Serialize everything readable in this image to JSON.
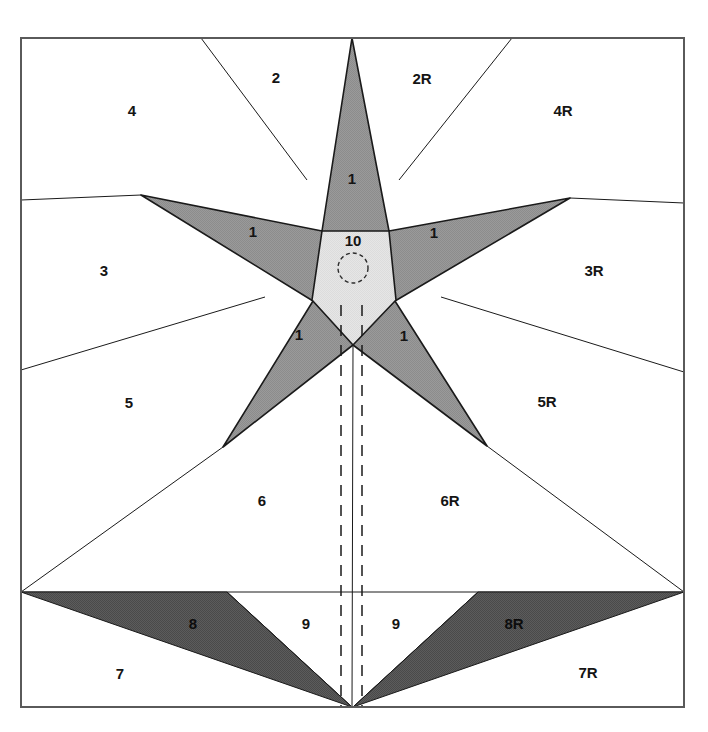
{
  "page": {
    "width": 708,
    "height": 732,
    "background": "#ffffff",
    "clipped_caption_left": "",
    "clipped_caption_right": ""
  },
  "figure": {
    "title": "",
    "frame": {
      "x": 21,
      "y": 38,
      "width": 663,
      "height": 669,
      "stroke": "#5a5a5a"
    },
    "colors": {
      "background": "#ffffff",
      "star_fill": "#9a9a9a",
      "core_fill": "#e2e2e2",
      "dark_fill": "#545454",
      "line": "#1a1a1a",
      "frame_line": "#5a5a5a",
      "label_text": "#141414"
    },
    "center_circle": {
      "cx": 353,
      "cy": 268,
      "r": 15,
      "style": "dashed"
    },
    "dashed_axes": [
      {
        "x": 341,
        "y1": 305,
        "y2": 707
      },
      {
        "x": 362,
        "y1": 305,
        "y2": 707
      }
    ],
    "regions": [
      {
        "id": "r1-top",
        "label": "1",
        "x": 352,
        "y": 180,
        "fill": "star"
      },
      {
        "id": "r1-upper-left",
        "label": "1",
        "x": 253,
        "y": 233,
        "fill": "star"
      },
      {
        "id": "r1-upper-right",
        "label": "1",
        "x": 434,
        "y": 234,
        "fill": "star"
      },
      {
        "id": "r1-lower-left",
        "label": "1",
        "x": 299,
        "y": 336,
        "fill": "star"
      },
      {
        "id": "r1-lower-right",
        "label": "1",
        "x": 404,
        "y": 337,
        "fill": "star"
      },
      {
        "id": "r10-core",
        "label": "10",
        "x": 353,
        "y": 242,
        "fill": "core"
      },
      {
        "id": "r2",
        "label": "2",
        "x": 276,
        "y": 79,
        "fill": "white"
      },
      {
        "id": "r2R",
        "label": "2R",
        "x": 422,
        "y": 80,
        "fill": "white"
      },
      {
        "id": "r4",
        "label": "4",
        "x": 132,
        "y": 112,
        "fill": "white"
      },
      {
        "id": "r4R",
        "label": "4R",
        "x": 563,
        "y": 112,
        "fill": "white"
      },
      {
        "id": "r3",
        "label": "3",
        "x": 104,
        "y": 272,
        "fill": "white"
      },
      {
        "id": "r3R",
        "label": "3R",
        "x": 594,
        "y": 272,
        "fill": "white"
      },
      {
        "id": "r5",
        "label": "5",
        "x": 129,
        "y": 404,
        "fill": "white"
      },
      {
        "id": "r5R",
        "label": "5R",
        "x": 547,
        "y": 403,
        "fill": "white"
      },
      {
        "id": "r6",
        "label": "6",
        "x": 262,
        "y": 502,
        "fill": "white"
      },
      {
        "id": "r6R",
        "label": "6R",
        "x": 450,
        "y": 502,
        "fill": "white"
      },
      {
        "id": "r7",
        "label": "7",
        "x": 120,
        "y": 675,
        "fill": "white"
      },
      {
        "id": "r7R",
        "label": "7R",
        "x": 588,
        "y": 674,
        "fill": "white"
      },
      {
        "id": "r8",
        "label": "8",
        "x": 193,
        "y": 625,
        "fill": "dark"
      },
      {
        "id": "r8R",
        "label": "8R",
        "x": 514,
        "y": 625,
        "fill": "dark"
      },
      {
        "id": "r9-left",
        "label": "9",
        "x": 306,
        "y": 625,
        "fill": "white"
      },
      {
        "id": "r9-right",
        "label": "9",
        "x": 396,
        "y": 625,
        "fill": "white"
      }
    ],
    "star_outer_points": [
      {
        "name": "top",
        "x": 352,
        "y": 38
      },
      {
        "name": "right",
        "x": 570,
        "y": 198
      },
      {
        "name": "lower-right",
        "x": 487,
        "y": 446
      },
      {
        "name": "lower-left",
        "x": 223,
        "y": 447
      },
      {
        "name": "left",
        "x": 141,
        "y": 195
      }
    ],
    "star_inner_points": [
      {
        "name": "upper-right",
        "x": 389,
        "y": 231
      },
      {
        "name": "right",
        "x": 395,
        "y": 301
      },
      {
        "name": "bottom",
        "x": 353,
        "y": 345
      },
      {
        "name": "left",
        "x": 313,
        "y": 301
      },
      {
        "name": "upper-left",
        "x": 322,
        "y": 231
      }
    ]
  }
}
